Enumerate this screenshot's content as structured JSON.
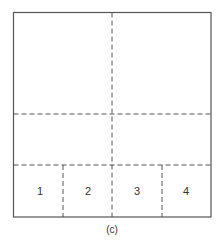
{
  "figure": {
    "caption": "(c)",
    "stroke_color": "#555555",
    "cells": [
      {
        "label": "1",
        "x": 40,
        "y": 191
      },
      {
        "label": "2",
        "x": 88,
        "y": 191
      },
      {
        "label": "3",
        "x": 137,
        "y": 191
      },
      {
        "label": "4",
        "x": 186,
        "y": 191
      }
    ]
  }
}
